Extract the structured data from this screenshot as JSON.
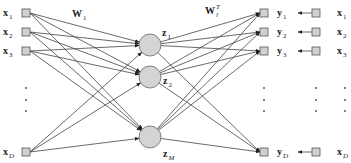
{
  "diagram": {
    "type": "autoencoder-network",
    "inputs": [
      {
        "base": "x",
        "sub": "1",
        "italic_sub": false
      },
      {
        "base": "x",
        "sub": "2",
        "italic_sub": false
      },
      {
        "base": "x",
        "sub": "3",
        "italic_sub": false
      },
      {
        "base": "x",
        "sub": "D",
        "italic_sub": true
      }
    ],
    "hidden": [
      {
        "base": "z",
        "sub": "1",
        "italic_sub": false
      },
      {
        "base": "z",
        "sub": "2",
        "italic_sub": false
      },
      {
        "base": "z",
        "sub": "M",
        "italic_sub": true
      }
    ],
    "outputs": [
      {
        "base": "y",
        "sub": "1",
        "italic_sub": false
      },
      {
        "base": "y",
        "sub": "2",
        "italic_sub": false
      },
      {
        "base": "y",
        "sub": "3",
        "italic_sub": false
      },
      {
        "base": "y",
        "sub": "D",
        "italic_sub": true
      }
    ],
    "targets": [
      {
        "base": "x",
        "sub": "1",
        "italic_sub": false
      },
      {
        "base": "x",
        "sub": "2",
        "italic_sub": false
      },
      {
        "base": "x",
        "sub": "3",
        "italic_sub": false
      },
      {
        "base": "x",
        "sub": "D",
        "italic_sub": true
      }
    ],
    "weights_encoder": {
      "base": "W",
      "sub": "1"
    },
    "weights_decoder": {
      "base": "W",
      "sub": "l",
      "sup": "T"
    },
    "ellipsis": "⋮"
  }
}
